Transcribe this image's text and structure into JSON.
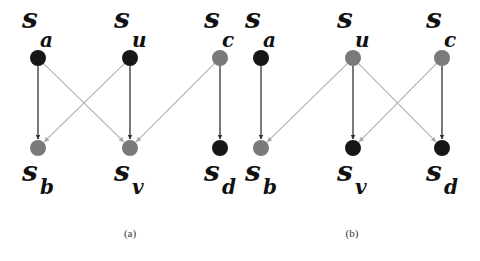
{
  "colors": {
    "node_dark": "#161616",
    "node_gray": "#7a7a7a",
    "edge_dark": "#333333",
    "edge_light": "#b0b0b0"
  },
  "graphs": [
    {
      "caption": "(a)",
      "caption_pos": [
        130,
        237
      ],
      "nodes": [
        {
          "id": "a",
          "label": "s",
          "sub": "a",
          "x": 38,
          "y": 58,
          "shade": "dark",
          "row": "top"
        },
        {
          "id": "u",
          "label": "s",
          "sub": "u",
          "x": 130,
          "y": 58,
          "shade": "dark",
          "row": "top"
        },
        {
          "id": "c",
          "label": "s",
          "sub": "c",
          "x": 220,
          "y": 58,
          "shade": "gray",
          "row": "top"
        },
        {
          "id": "b",
          "label": "s",
          "sub": "b",
          "x": 38,
          "y": 148,
          "shade": "gray",
          "row": "bottom"
        },
        {
          "id": "v",
          "label": "s",
          "sub": "v",
          "x": 130,
          "y": 148,
          "shade": "gray",
          "row": "bottom"
        },
        {
          "id": "d",
          "label": "s",
          "sub": "d",
          "x": 220,
          "y": 148,
          "shade": "dark",
          "row": "bottom"
        }
      ],
      "edges": [
        {
          "from": "a",
          "to": "b",
          "style": "dark"
        },
        {
          "from": "a",
          "to": "v",
          "style": "light"
        },
        {
          "from": "u",
          "to": "b",
          "style": "light"
        },
        {
          "from": "u",
          "to": "v",
          "style": "dark"
        },
        {
          "from": "c",
          "to": "v",
          "style": "light"
        },
        {
          "from": "c",
          "to": "d",
          "style": "dark"
        }
      ]
    },
    {
      "caption": "(b)",
      "caption_pos": [
        352,
        237
      ],
      "nodes": [
        {
          "id": "a",
          "label": "s",
          "sub": "a",
          "x": 261,
          "y": 58,
          "shade": "dark",
          "row": "top"
        },
        {
          "id": "u",
          "label": "s",
          "sub": "u",
          "x": 353,
          "y": 58,
          "shade": "gray",
          "row": "top"
        },
        {
          "id": "c",
          "label": "s",
          "sub": "c",
          "x": 442,
          "y": 58,
          "shade": "gray",
          "row": "top"
        },
        {
          "id": "b",
          "label": "s",
          "sub": "b",
          "x": 261,
          "y": 148,
          "shade": "gray",
          "row": "bottom"
        },
        {
          "id": "v",
          "label": "s",
          "sub": "v",
          "x": 353,
          "y": 148,
          "shade": "dark",
          "row": "bottom"
        },
        {
          "id": "d",
          "label": "s",
          "sub": "d",
          "x": 442,
          "y": 148,
          "shade": "dark",
          "row": "bottom"
        }
      ],
      "edges": [
        {
          "from": "a",
          "to": "b",
          "style": "dark"
        },
        {
          "from": "u",
          "to": "b",
          "style": "light"
        },
        {
          "from": "u",
          "to": "v",
          "style": "dark"
        },
        {
          "from": "u",
          "to": "d",
          "style": "light"
        },
        {
          "from": "c",
          "to": "v",
          "style": "light"
        },
        {
          "from": "c",
          "to": "d",
          "style": "dark"
        }
      ]
    }
  ]
}
